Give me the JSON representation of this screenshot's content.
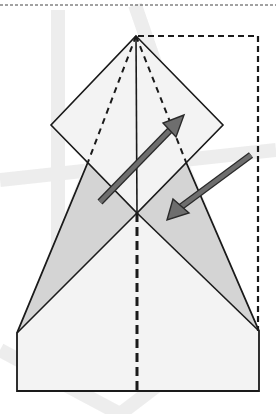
{
  "diagram": {
    "type": "origami-fold-step",
    "colors": {
      "paper": "#f3f3f3",
      "shaded": "#d4d4d4",
      "line": "#1a1a1a",
      "arrow_fill": "#6e6e6e",
      "arrow_outline": "#2a2a2a",
      "watermark": "#ececec",
      "background": "#ffffff"
    },
    "points": {
      "apex": [
        136,
        36
      ],
      "diamond_left": [
        51,
        125
      ],
      "diamond_right": [
        223,
        125
      ],
      "diamond_bottom": [
        137,
        213
      ],
      "left_crease_hit": [
        88,
        162
      ],
      "right_crease_hit": [
        186,
        162
      ],
      "left_shoulder": [
        17,
        333
      ],
      "right_shoulder": [
        259,
        331
      ],
      "bottom_left": [
        17,
        391
      ],
      "bottom_right": [
        259,
        391
      ],
      "bottom_center": [
        137,
        391
      ]
    },
    "lines": {
      "top_separator": {
        "y": 5,
        "style": "dotted"
      },
      "dashed_frame": {
        "x1": 136,
        "y1": 36,
        "x2": 258,
        "y2": 331,
        "style": "dashed"
      },
      "center_solid": {
        "from": [
          136,
          36
        ],
        "to": [
          137,
          213
        ]
      },
      "center_dashed": {
        "from": [
          137,
          213
        ],
        "to": [
          137,
          391
        ]
      }
    },
    "arrows": [
      {
        "name": "fold-up-arrow",
        "tail": [
          100,
          202
        ],
        "head": [
          184,
          115
        ]
      },
      {
        "name": "fold-down-arrow",
        "tail": [
          251,
          155
        ],
        "head": [
          167,
          220
        ]
      }
    ]
  }
}
